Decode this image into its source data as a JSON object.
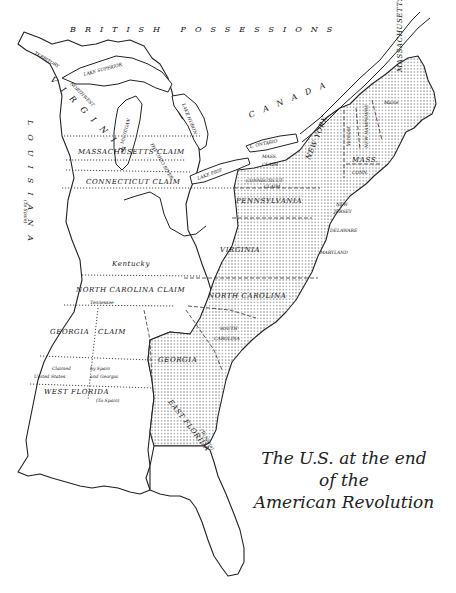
{
  "title": {
    "line1": "The U.S. at the end",
    "line2": "of the",
    "line3": "American Revolution"
  },
  "regions": {
    "british_possessions": "BRITISH POSSESSIONS",
    "canada": "CANADA",
    "louisiana": "LOUISIANA",
    "louisiana_note": "(To Spain)",
    "virginia_territory": "VIRGINIA",
    "territory": "TERRITORY",
    "northwest": "NORTHWEST",
    "massachusetts_claim": "MASSACHUSETTS CLAIM",
    "connecticut_claim": "CONNECTICUT CLAIM",
    "connecticut_claim_pa_1": "CONNECTICUT",
    "connecticut_claim_pa_2": "CLAIM",
    "mass_claim_ny_1": "MASS.",
    "mass_claim_ny_2": "CLAIM",
    "kentucky": "Kentucky",
    "north_carolina_claim": "NORTH CAROLINA CLAIM",
    "tennessee": "Tennessee",
    "georgia_claim_1": "GEORGIA",
    "georgia_claim_2": "CLAIM",
    "disputed_1a": "Claimed",
    "disputed_1b": "United States",
    "disputed_2a": "by Spain",
    "disputed_2b": "and Georgia",
    "west_florida": "WEST FLORIDA",
    "west_florida_note": "(To Spain)",
    "east_florida": "EAST FLORIDA",
    "east_florida_note": "(To Spain)"
  },
  "states": {
    "new_york": "NEW YORK",
    "pennsylvania": "PENNSYLVANIA",
    "new_jersey_1": "NEW",
    "new_jersey_2": "JERSEY",
    "delaware": "DELAWARE",
    "maryland": "MARYLAND",
    "virginia": "VIRGINIA",
    "north_carolina": "NORTH CAROLINA",
    "south_carolina_1": "SOUTH",
    "south_carolina_2": "CAROLINA",
    "georgia": "GEORGIA",
    "massachusetts": "MASSACHUSETTS",
    "mass_abbrev": "MASS.",
    "maine_part": "Maine",
    "connecticut": "CONN.",
    "new_hampshire": "NEW HAMPSHIRE",
    "vermont": "Vermont",
    "vermont_note": "(claimed by N.Y. & N.H.)"
  },
  "water": {
    "lake_superior": "LAKE SUPERIOR",
    "lake_michigan": "L. MICHIGAN",
    "lake_huron": "LAKE HURON",
    "lake_erie": "LAKE ERIE",
    "lake_ontario": "L. ONTARIO",
    "ohio_river": "THE OHIO RIVER"
  },
  "colors": {
    "ink": "#222222",
    "background": "#ffffff",
    "dot_fill": "#333333"
  }
}
